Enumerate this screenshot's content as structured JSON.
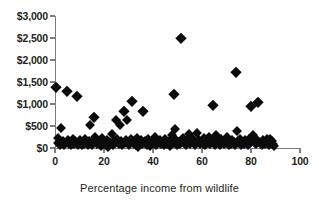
{
  "chart_data": {
    "type": "scatter",
    "title": "",
    "subtitle": "",
    "xlabel": "Percentage income from wildlife",
    "ylabel": "",
    "xlim": [
      0,
      100
    ],
    "ylim": [
      0,
      3000
    ],
    "grid": false,
    "legend": null,
    "legend_position": "none",
    "marker": "diamond",
    "marker_color": "#0b0b0b",
    "axis_color": "#7d7d7d",
    "x_ticks": [
      0,
      20,
      40,
      60,
      80,
      100
    ],
    "x_tick_labels": [
      "0",
      "20",
      "40",
      "60",
      "80",
      "100"
    ],
    "y_ticks": [
      0,
      500,
      1000,
      1500,
      2000,
      2500,
      3000
    ],
    "y_tick_labels": [
      "$0",
      "$500",
      "$1,000",
      "$1,500",
      "$2,000",
      "$2,500",
      "$3,000"
    ],
    "series": [
      {
        "name": "households",
        "points": [
          [
            0.6,
            1390
          ],
          [
            1.1,
            230
          ],
          [
            1.4,
            120
          ],
          [
            2.0,
            70
          ],
          [
            2.6,
            450
          ],
          [
            3.1,
            150
          ],
          [
            3.6,
            60
          ],
          [
            4.2,
            110
          ],
          [
            4.8,
            1300
          ],
          [
            5.2,
            180
          ],
          [
            5.7,
            80
          ],
          [
            6.1,
            130
          ],
          [
            6.6,
            60
          ],
          [
            7.2,
            200
          ],
          [
            7.8,
            100
          ],
          [
            8.3,
            150
          ],
          [
            8.9,
            1190
          ],
          [
            9.3,
            70
          ],
          [
            9.8,
            120
          ],
          [
            10.3,
            180
          ],
          [
            10.9,
            60
          ],
          [
            11.4,
            140
          ],
          [
            11.9,
            90
          ],
          [
            12.4,
            200
          ],
          [
            13.0,
            110
          ],
          [
            13.5,
            70
          ],
          [
            14.0,
            160
          ],
          [
            14.4,
            520
          ],
          [
            14.9,
            120
          ],
          [
            15.3,
            60
          ],
          [
            15.8,
            710
          ],
          [
            16.2,
            250
          ],
          [
            16.7,
            140
          ],
          [
            17.2,
            80
          ],
          [
            17.7,
            170
          ],
          [
            18.2,
            110
          ],
          [
            18.7,
            50
          ],
          [
            19.2,
            220
          ],
          [
            19.7,
            130
          ],
          [
            20.2,
            90
          ],
          [
            20.7,
            60
          ],
          [
            21.2,
            180
          ],
          [
            21.6,
            30
          ],
          [
            22.1,
            140
          ],
          [
            22.6,
            110
          ],
          [
            23.1,
            310
          ],
          [
            23.6,
            70
          ],
          [
            24.1,
            160
          ],
          [
            24.6,
            120
          ],
          [
            25.1,
            640
          ],
          [
            25.5,
            200
          ],
          [
            26.0,
            90
          ],
          [
            26.5,
            530
          ],
          [
            27.0,
            150
          ],
          [
            27.5,
            60
          ],
          [
            28.0,
            840
          ],
          [
            28.4,
            110
          ],
          [
            28.9,
            180
          ],
          [
            29.4,
            640
          ],
          [
            29.9,
            130
          ],
          [
            30.4,
            70
          ],
          [
            30.9,
            200
          ],
          [
            31.4,
            1060
          ],
          [
            31.9,
            150
          ],
          [
            32.4,
            100
          ],
          [
            32.9,
            60
          ],
          [
            33.4,
            220
          ],
          [
            33.9,
            30
          ],
          [
            34.4,
            140
          ],
          [
            34.9,
            190
          ],
          [
            35.4,
            90
          ],
          [
            35.9,
            850
          ],
          [
            36.4,
            120
          ],
          [
            36.9,
            160
          ],
          [
            37.4,
            70
          ],
          [
            37.9,
            210
          ],
          [
            38.4,
            110
          ],
          [
            38.9,
            50
          ],
          [
            39.4,
            170
          ],
          [
            39.9,
            130
          ],
          [
            40.4,
            90
          ],
          [
            40.9,
            240
          ],
          [
            41.4,
            60
          ],
          [
            41.9,
            150
          ],
          [
            42.4,
            110
          ],
          [
            42.9,
            190
          ],
          [
            43.4,
            80
          ],
          [
            43.9,
            130
          ],
          [
            44.4,
            60
          ],
          [
            44.9,
            200
          ],
          [
            45.4,
            120
          ],
          [
            45.9,
            90
          ],
          [
            46.4,
            160
          ],
          [
            46.9,
            40
          ],
          [
            47.4,
            140
          ],
          [
            47.9,
            300
          ],
          [
            48.4,
            110
          ],
          [
            48.7,
            1220
          ],
          [
            49.0,
            440
          ],
          [
            49.4,
            180
          ],
          [
            49.9,
            70
          ],
          [
            50.4,
            130
          ],
          [
            50.9,
            90
          ],
          [
            51.3,
            2510
          ],
          [
            51.8,
            160
          ],
          [
            52.3,
            220
          ],
          [
            52.8,
            110
          ],
          [
            53.3,
            60
          ],
          [
            53.8,
            180
          ],
          [
            54.3,
            130
          ],
          [
            54.8,
            320
          ],
          [
            55.3,
            90
          ],
          [
            55.8,
            150
          ],
          [
            56.3,
            200
          ],
          [
            56.8,
            110
          ],
          [
            57.3,
            60
          ],
          [
            57.8,
            330
          ],
          [
            58.3,
            140
          ],
          [
            58.8,
            190
          ],
          [
            59.3,
            80
          ],
          [
            59.8,
            130
          ],
          [
            60.3,
            100
          ],
          [
            60.8,
            220
          ],
          [
            61.3,
            60
          ],
          [
            61.8,
            160
          ],
          [
            62.3,
            110
          ],
          [
            62.8,
            260
          ],
          [
            63.3,
            90
          ],
          [
            63.8,
            140
          ],
          [
            64.3,
            190
          ],
          [
            64.6,
            980
          ],
          [
            64.9,
            120
          ],
          [
            65.4,
            70
          ],
          [
            65.9,
            300
          ],
          [
            66.4,
            150
          ],
          [
            66.9,
            110
          ],
          [
            67.4,
            60
          ],
          [
            67.9,
            200
          ],
          [
            68.4,
            130
          ],
          [
            68.9,
            90
          ],
          [
            69.4,
            170
          ],
          [
            69.9,
            110
          ],
          [
            70.4,
            240
          ],
          [
            70.9,
            60
          ],
          [
            71.4,
            150
          ],
          [
            71.9,
            100
          ],
          [
            72.4,
            190
          ],
          [
            72.9,
            130
          ],
          [
            73.4,
            70
          ],
          [
            73.9,
            1720
          ],
          [
            74.2,
            390
          ],
          [
            74.6,
            160
          ],
          [
            75.1,
            110
          ],
          [
            75.6,
            200
          ],
          [
            76.1,
            60
          ],
          [
            76.6,
            140
          ],
          [
            77.1,
            100
          ],
          [
            77.6,
            180
          ],
          [
            78.1,
            130
          ],
          [
            78.6,
            70
          ],
          [
            79.1,
            210
          ],
          [
            79.6,
            110
          ],
          [
            80.1,
            950
          ],
          [
            80.5,
            160
          ],
          [
            81.0,
            290
          ],
          [
            81.5,
            120
          ],
          [
            82.0,
            80
          ],
          [
            82.5,
            190
          ],
          [
            83.0,
            1050
          ],
          [
            83.4,
            140
          ],
          [
            83.9,
            100
          ],
          [
            84.4,
            60
          ],
          [
            84.9,
            180
          ],
          [
            85.4,
            130
          ],
          [
            85.9,
            90
          ],
          [
            86.4,
            200
          ],
          [
            86.9,
            110
          ],
          [
            87.4,
            60
          ],
          [
            87.9,
            210
          ],
          [
            88.4,
            150
          ],
          [
            88.9,
            90
          ],
          [
            89.4,
            40
          ]
        ]
      }
    ]
  }
}
